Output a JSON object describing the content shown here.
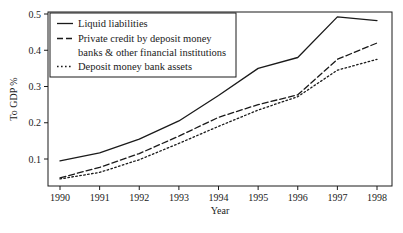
{
  "chart_data": {
    "type": "line",
    "title": "",
    "xlabel": "Year",
    "ylabel": "To GDP %",
    "categories": [
      "1990",
      "1991",
      "1992",
      "1993",
      "1994",
      "1995",
      "1996",
      "1997",
      "1998"
    ],
    "x": [
      1990,
      1991,
      1992,
      1993,
      1994,
      1995,
      1996,
      1997,
      1998
    ],
    "xlim": [
      1990,
      1998
    ],
    "ylim": [
      0.0,
      0.52
    ],
    "yticks": [
      "0.1",
      "0.2",
      "0.3",
      "0.4",
      "0.5"
    ],
    "ytick_values": [
      0.1,
      0.2,
      0.3,
      0.4,
      0.5
    ],
    "xticks": [
      "1990",
      "1991",
      "1992",
      "1993",
      "1994",
      "1995",
      "1996",
      "1997",
      "1998"
    ],
    "grid": false,
    "legend_position": "top-left",
    "series": [
      {
        "name": "Liquid liabilities",
        "style": "solid",
        "values": [
          0.095,
          0.117,
          0.155,
          0.205,
          0.275,
          0.35,
          0.38,
          0.492,
          0.482
        ]
      },
      {
        "name": "Private credit by deposit money banks & other financial institutions",
        "style": "dashed",
        "values": [
          0.048,
          0.077,
          0.115,
          0.163,
          0.215,
          0.25,
          0.277,
          0.375,
          0.42
        ]
      },
      {
        "name": "Deposit money bank assets",
        "style": "dotted",
        "values": [
          0.045,
          0.063,
          0.098,
          0.143,
          0.19,
          0.235,
          0.272,
          0.345,
          0.375
        ]
      }
    ],
    "line_color": "#1a1a1a",
    "background_color": "#ffffff"
  },
  "legend": {
    "entries": [
      {
        "label": "Liquid liabilities",
        "style": "solid"
      },
      {
        "label": "Private credit by deposit money",
        "style": "dashed"
      },
      {
        "label": "banks & other financial institutions",
        "style": "none"
      },
      {
        "label": "Deposit money bank assets",
        "style": "dotted"
      }
    ]
  },
  "axes": {
    "y_title": "To GDP %",
    "x_title": "Year",
    "y_tick_labels": [
      "0.5",
      "0.4",
      "0.3",
      "0.2",
      "0.1"
    ],
    "x_tick_labels": [
      "1990",
      "1991",
      "1992",
      "1993",
      "1994",
      "1995",
      "1996",
      "1997",
      "1998"
    ]
  }
}
